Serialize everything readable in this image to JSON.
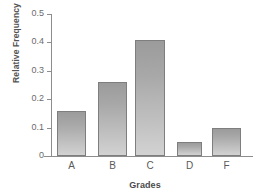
{
  "chart_data": {
    "type": "bar",
    "title": "",
    "xlabel": "Grades",
    "ylabel": "Relative Frequency",
    "categories": [
      "A",
      "B",
      "C",
      "D",
      "F"
    ],
    "values": [
      0.16,
      0.26,
      0.41,
      0.05,
      0.1
    ],
    "ylim": [
      0,
      0.5
    ],
    "ytick_values": [
      0,
      0.1,
      0.2,
      0.3,
      0.4,
      0.5
    ],
    "ytick_labels": [
      "0",
      "0.1",
      "0.2",
      "0.3",
      "0.4",
      "0.5"
    ],
    "grid": false,
    "legend": null,
    "series": [
      {
        "name": "Relative Frequency",
        "values": [
          0.16,
          0.26,
          0.41,
          0.05,
          0.1
        ]
      }
    ],
    "colors": {
      "bar_top": "#9b9b9b",
      "bar_bottom": "#d2d2d2",
      "bar_border": "#7e7e7e",
      "axis": "#8d8d8d",
      "tick_text": "#6b6b6b",
      "label_text": "#4a4a4a",
      "background": "#ffffff"
    }
  }
}
